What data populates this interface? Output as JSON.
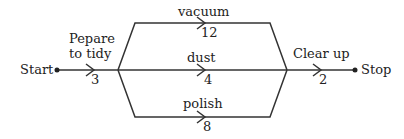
{
  "diagram": {
    "type": "activity network",
    "nodes": {
      "start": "Start",
      "stop": "Stop"
    },
    "activities": [
      {
        "id": "prepare",
        "label_line1": "Pepare",
        "label_line2": "to tidy",
        "duration": "3"
      },
      {
        "id": "vacuum",
        "label": "vacuum",
        "duration": "12"
      },
      {
        "id": "dust",
        "label": "dust",
        "duration": "4"
      },
      {
        "id": "polish",
        "label": "polish",
        "duration": "8"
      },
      {
        "id": "clear",
        "label": "Clear up",
        "duration": "2"
      }
    ],
    "colors": {
      "line": "#333333",
      "text": "#222222"
    }
  }
}
